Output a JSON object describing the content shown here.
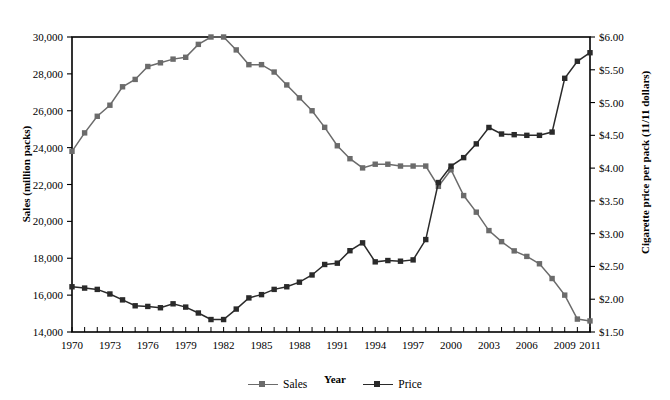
{
  "axis_titles": {
    "x": "Year",
    "y_left": "Sales (million packs)",
    "y_right": "Cigarette price per pack (11/11 dollars)"
  },
  "legend": {
    "items": [
      {
        "label": "Sales",
        "color": "#6b6b6b",
        "marker": "square"
      },
      {
        "label": "Price",
        "color": "#2a2a2a",
        "marker": "square"
      }
    ]
  },
  "colors": {
    "sales": "#6b6b6b",
    "price": "#2a2a2a",
    "frame": "#000000",
    "text": "#000000"
  },
  "chart_data": {
    "type": "line",
    "title": "",
    "xlabel": "Year",
    "grid": false,
    "legend_position": "bottom",
    "x": [
      1970,
      1971,
      1972,
      1973,
      1974,
      1975,
      1976,
      1977,
      1978,
      1979,
      1980,
      1981,
      1982,
      1983,
      1984,
      1985,
      1986,
      1987,
      1988,
      1989,
      1990,
      1991,
      1992,
      1993,
      1994,
      1995,
      1996,
      1997,
      1998,
      1999,
      2000,
      2001,
      2002,
      2003,
      2004,
      2005,
      2006,
      2007,
      2008,
      2009,
      2010,
      2011
    ],
    "xtick_labels": [
      "1970",
      "1973",
      "1976",
      "1979",
      "1982",
      "1985",
      "1988",
      "1991",
      "1994",
      "1997",
      "2000",
      "2003",
      "2006",
      "2009",
      "2011"
    ],
    "xtick_values": [
      1970,
      1973,
      1976,
      1979,
      1982,
      1985,
      1988,
      1991,
      1994,
      1997,
      2000,
      2003,
      2006,
      2009,
      2011
    ],
    "xlim": [
      1970,
      2011
    ],
    "axes": [
      {
        "name": "left",
        "ylabel": "Sales (million packs)",
        "ylim": [
          14000,
          30000
        ],
        "ytick_values": [
          14000,
          16000,
          18000,
          20000,
          22000,
          24000,
          26000,
          28000,
          30000
        ],
        "ytick_labels": [
          "14,000",
          "16,000",
          "18,000",
          "20,000",
          "22,000",
          "24,000",
          "26,000",
          "28,000",
          "30,000"
        ]
      },
      {
        "name": "right",
        "ylabel": "Cigarette price per pack (11/11 dollars)",
        "ylim": [
          1.5,
          6.0
        ],
        "ytick_values": [
          1.5,
          2.0,
          2.5,
          3.0,
          3.5,
          4.0,
          4.5,
          5.0,
          5.5,
          6.0
        ],
        "ytick_labels": [
          "$1.50",
          "$2.00",
          "$2.50",
          "$3.00",
          "$3.50",
          "$4.00",
          "$4.50",
          "$5.00",
          "$5.50",
          "$6.00"
        ]
      }
    ],
    "series": [
      {
        "name": "Sales",
        "axis": "left",
        "unit": "million packs",
        "color": "#6b6b6b",
        "values": [
          23800,
          24800,
          25700,
          26300,
          27300,
          27700,
          28400,
          28600,
          28800,
          28900,
          29600,
          30000,
          30000,
          29300,
          28500,
          28500,
          28100,
          27400,
          26700,
          26000,
          25100,
          24100,
          23400,
          22900,
          23100,
          23100,
          23000,
          23000,
          23000,
          21900,
          22800,
          21400,
          20500,
          19500,
          18900,
          18400,
          18100,
          17700,
          16900,
          16000,
          14700,
          14600
        ]
      },
      {
        "name": "Price",
        "axis": "right",
        "unit": "dollars per pack (11/11 dollars)",
        "color": "#2a2a2a",
        "values": [
          2.19,
          2.17,
          2.15,
          2.08,
          1.99,
          1.9,
          1.89,
          1.87,
          1.93,
          1.88,
          1.79,
          1.69,
          1.69,
          1.85,
          2.02,
          2.07,
          2.15,
          2.19,
          2.26,
          2.37,
          2.53,
          2.55,
          2.74,
          2.86,
          2.57,
          2.59,
          2.58,
          2.6,
          2.91,
          3.78,
          4.03,
          4.16,
          4.37,
          4.62,
          4.52,
          4.51,
          4.5,
          4.5,
          4.55,
          5.37,
          5.63,
          5.76
        ]
      }
    ],
    "notes": {
      "crossover_year": 2000,
      "sales_peak": {
        "years": [
          1981,
          1982
        ],
        "value": 30000
      },
      "price_min": {
        "years": [
          1981,
          1982
        ],
        "value": 1.69
      },
      "price_local_peak": {
        "year": 1993,
        "value": 2.86
      }
    }
  }
}
